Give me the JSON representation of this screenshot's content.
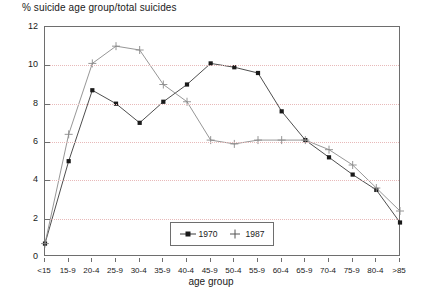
{
  "chart_data": {
    "type": "line",
    "title": "% suicide age group/total suicides",
    "xlabel": "age group",
    "ylabel": "",
    "ylim": [
      0,
      12
    ],
    "yticks": [
      0,
      2,
      4,
      6,
      8,
      10,
      12
    ],
    "grid": true,
    "legend_position": "bottom-center",
    "categories": [
      "<15",
      "15-9",
      "20-4",
      "25-9",
      "30-4",
      "35-9",
      "40-4",
      "45-9",
      "50-4",
      "55-9",
      "60-4",
      "65-9",
      "70-4",
      "75-9",
      "80-4",
      ">85"
    ],
    "series": [
      {
        "name": "1970",
        "marker": "filled-square",
        "values": [
          0.7,
          5.0,
          8.7,
          8.0,
          7.0,
          8.1,
          9.0,
          10.1,
          9.9,
          9.6,
          7.6,
          6.1,
          5.2,
          4.3,
          3.5,
          1.8
        ]
      },
      {
        "name": "1987",
        "marker": "plus",
        "values": [
          0.7,
          6.4,
          10.1,
          11.0,
          10.8,
          9.0,
          8.1,
          6.1,
          5.9,
          6.1,
          6.1,
          6.1,
          5.6,
          4.8,
          3.6,
          2.4
        ]
      }
    ],
    "colors": {
      "axis": "#6e6e6e",
      "grid": "#e8b9b9",
      "series_1970": "#3a3a3a",
      "series_1987": "#8a8a8a",
      "background": "#ffffff"
    }
  },
  "legend": {
    "items": [
      {
        "label": "1970"
      },
      {
        "label": "1987"
      }
    ]
  }
}
